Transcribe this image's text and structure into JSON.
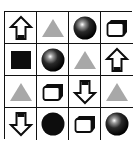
{
  "puzzle": {
    "rows": 4,
    "cols": 4,
    "cells": [
      [
        "arrow-up",
        "triangle",
        "sphere",
        "box"
      ],
      [
        "square",
        "sphere",
        "triangle",
        "arrow-up"
      ],
      [
        "triangle",
        "box",
        "arrow-down",
        "triangle"
      ],
      [
        "arrow-down",
        "circle",
        "box",
        "sphere"
      ]
    ]
  },
  "colors": {
    "grid_line": "#111111",
    "triangle": "#a8a8a8",
    "dark": "#0d0d0d",
    "background": "#ffffff"
  }
}
